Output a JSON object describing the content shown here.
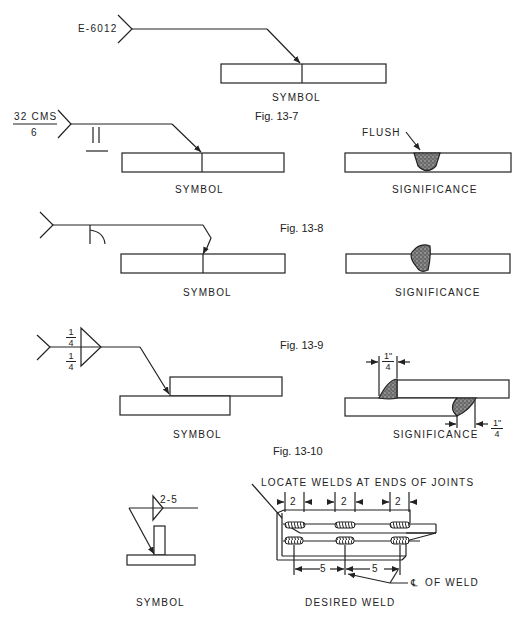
{
  "figures": [
    {
      "id": "fig-13-6-partial",
      "symbol": {
        "tail_text": "E-6012",
        "label": "SYMBOL"
      }
    },
    {
      "id": "fig-13-7",
      "caption": "Fig. 13-7",
      "symbol": {
        "tail_text_top": "32 CMS",
        "tail_text_bottom": "6",
        "label": "SYMBOL"
      },
      "significance": {
        "callout": "FLUSH",
        "label": "SIGNIFICANCE"
      }
    },
    {
      "id": "fig-13-8",
      "caption": "Fig. 13-8",
      "symbol": {
        "label": "SYMBOL"
      },
      "significance": {
        "label": "SIGNIFICANCE"
      }
    },
    {
      "id": "fig-13-9",
      "caption": "Fig. 13-9",
      "symbol": {
        "size_top_num": "1",
        "size_top_den": "4",
        "size_bottom_num": "1",
        "size_bottom_den": "4",
        "label": "SYMBOL"
      },
      "significance": {
        "dim_top_num": "1\"",
        "dim_top_den": "4",
        "dim_bottom_num": "1\"",
        "dim_bottom_den": "4",
        "label": "SIGNIFICANCE"
      }
    },
    {
      "id": "fig-13-10",
      "caption": "Fig. 13-10",
      "symbol": {
        "weld_spec": "2-5",
        "label": "SYMBOL"
      },
      "desired_weld": {
        "callout": "LOCATE WELDS AT ENDS OF JOINTS",
        "length_dims": [
          "2",
          "2",
          "2"
        ],
        "pitch_dims": [
          "5",
          "5"
        ],
        "centerline_callout": "OF WELD",
        "centerline_symbol": "℄",
        "label": "DESIRED WELD"
      }
    }
  ]
}
